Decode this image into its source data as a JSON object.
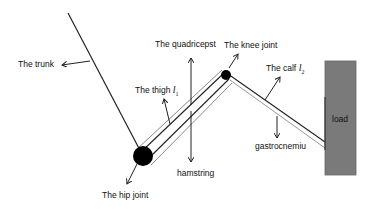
{
  "labels": {
    "trunk": "The trunk",
    "quadriceps": "The quadricepst",
    "knee_joint": "The knee joint",
    "thigh": "The thigh",
    "thigh_symbol": "l",
    "thigh_sub": "1",
    "calf": "The calf",
    "calf_symbol": "l",
    "calf_sub": "2",
    "load": "load",
    "gastrocnemius": "gastrocnemiu",
    "hamstring": "hamstring",
    "hip_joint": "The hip joint"
  },
  "colors": {
    "line": "#222222",
    "joint": "#000000",
    "load_fill": "#7a7a7a",
    "load_border": "#555555"
  }
}
